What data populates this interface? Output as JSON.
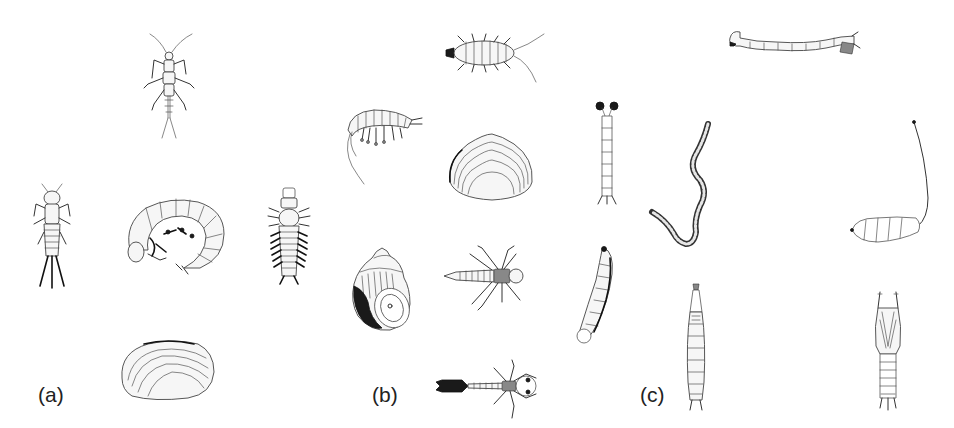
{
  "figure": {
    "panels": [
      {
        "label": "(a)",
        "organisms": [
          {
            "id": "stonefly-nymph-top",
            "name": "stonefly-nymph"
          },
          {
            "id": "mayfly-nymph",
            "name": "mayfly-nymph"
          },
          {
            "id": "caddisfly-larva-curled",
            "name": "caddisfly-larva"
          },
          {
            "id": "hellgrammite",
            "name": "dobsonfly-larva"
          },
          {
            "id": "mussel",
            "name": "freshwater-mussel"
          }
        ]
      },
      {
        "label": "(b)",
        "organisms": [
          {
            "id": "sowbug",
            "name": "aquatic-sowbug"
          },
          {
            "id": "scud",
            "name": "scud-amphipod"
          },
          {
            "id": "clam",
            "name": "fingernail-clam"
          },
          {
            "id": "snail",
            "name": "gilled-snail"
          },
          {
            "id": "damselfly-nymph",
            "name": "damselfly-nymph"
          },
          {
            "id": "crane-fly",
            "name": "dragonfly-nymph"
          }
        ]
      },
      {
        "label": "(c)",
        "organisms": [
          {
            "id": "midge-larva",
            "name": "midge-larva"
          },
          {
            "id": "blackfly-larva-slim",
            "name": "blackfly-larva"
          },
          {
            "id": "aquatic-worm",
            "name": "aquatic-worm"
          },
          {
            "id": "rat-tailed-maggot",
            "name": "rat-tailed-maggot"
          },
          {
            "id": "leech",
            "name": "leech"
          },
          {
            "id": "mosquito-larva",
            "name": "mosquito-larva"
          },
          {
            "id": "pupa",
            "name": "pupa"
          }
        ]
      }
    ],
    "colors": {
      "background": "#ffffff",
      "ink": "#222222"
    }
  }
}
